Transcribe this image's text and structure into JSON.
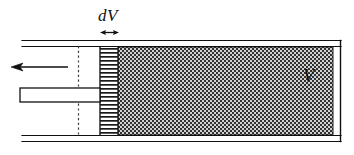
{
  "figure": {
    "title": "dV",
    "type": "thermodynamics-cylinder-diagram",
    "labels": {
      "differential_volume": "dV",
      "volume": "V"
    },
    "colors": {
      "ink": "#101010",
      "background": "#ffffff",
      "stipple_dark": "#2b2b2b",
      "stipple_light": "#c9c9c9",
      "hatch": "#1a1a1a"
    },
    "elements": {
      "motion_arrow": {
        "name": "leftward-motion-arrow",
        "direction": "left",
        "tip_x": 12,
        "tail_x": 68,
        "y": 67
      },
      "piston_rod": {
        "name": "piston-rod",
        "x": 20,
        "y": 88,
        "width": 80,
        "height": 14
      },
      "dashed_reference_line": {
        "name": "dashed-reference-line",
        "x": 78,
        "y_top": 46,
        "y_bottom": 136
      },
      "dv_slab": {
        "name": "differential-volume-slab",
        "x": 100,
        "width": 18,
        "fill": "horizontal-hatch"
      },
      "volume_region": {
        "name": "gas-volume-region",
        "x": 118,
        "width": 215,
        "fill": "checker-stipple"
      },
      "cylinder": {
        "name": "cylinder-wall",
        "left": 22,
        "right": 341,
        "top": 44,
        "bottom": 138,
        "wall_style": "double-line"
      },
      "dimension_marker": {
        "name": "dv-dimension-marker",
        "x_left": 101,
        "x_right": 118,
        "y": 32
      }
    }
  }
}
